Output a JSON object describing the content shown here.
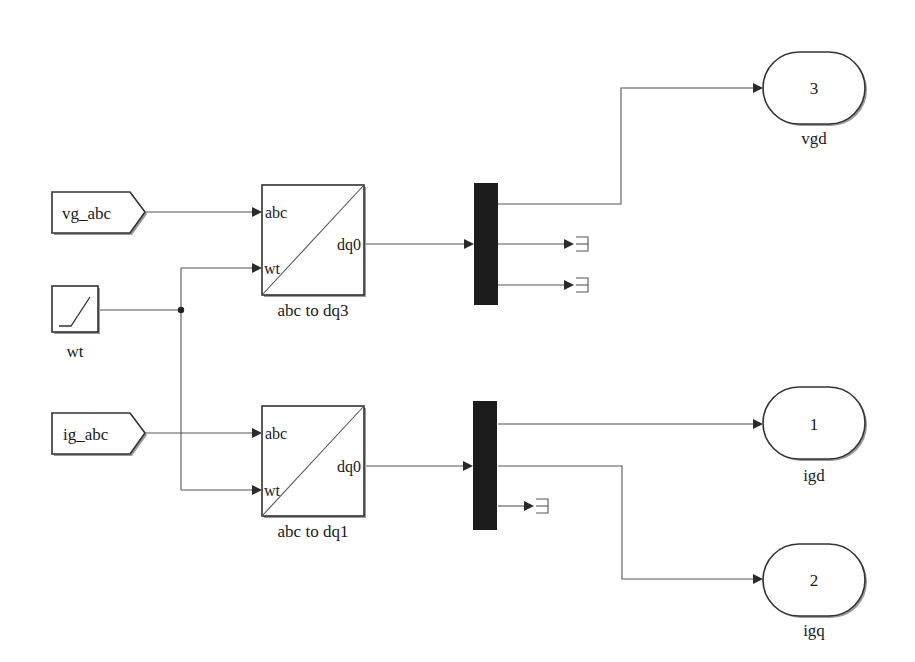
{
  "diagram": {
    "type": "simulink-block-diagram",
    "from_tags": [
      {
        "id": "from-vg-abc",
        "label": "vg_abc"
      },
      {
        "id": "from-ig-abc",
        "label": "ig_abc"
      }
    ],
    "sources": [
      {
        "id": "ramp-wt",
        "label": "wt",
        "icon": "ramp-icon"
      }
    ],
    "transforms": [
      {
        "id": "abc-to-dq3",
        "name": "abc to dq3",
        "inputs": [
          "abc",
          "wt"
        ],
        "output": "dq0"
      },
      {
        "id": "abc-to-dq1",
        "name": "abc to dq1",
        "inputs": [
          "abc",
          "wt"
        ],
        "output": "dq0"
      }
    ],
    "demuxes": [
      {
        "id": "demux-v",
        "outputs": 3
      },
      {
        "id": "demux-i",
        "outputs": 3
      }
    ],
    "outports": [
      {
        "id": "outport-vgd",
        "number": "3",
        "label": "vgd"
      },
      {
        "id": "outport-igd",
        "number": "1",
        "label": "igd"
      },
      {
        "id": "outport-igq",
        "number": "2",
        "label": "igq"
      }
    ],
    "terminators": 3,
    "connections": [
      {
        "from": "vg_abc",
        "to": "abc to dq3.abc"
      },
      {
        "from": "wt",
        "to": "abc to dq3.wt"
      },
      {
        "from": "wt",
        "to": "abc to dq1.wt"
      },
      {
        "from": "ig_abc",
        "to": "abc to dq1.abc"
      },
      {
        "from": "abc to dq3.dq0",
        "to": "demux-v"
      },
      {
        "from": "demux-v.1",
        "to": "vgd"
      },
      {
        "from": "demux-v.2",
        "to": "terminator"
      },
      {
        "from": "demux-v.3",
        "to": "terminator"
      },
      {
        "from": "abc to dq1.dq0",
        "to": "demux-i"
      },
      {
        "from": "demux-i.1",
        "to": "igd"
      },
      {
        "from": "demux-i.2",
        "to": "igq"
      },
      {
        "from": "demux-i.3",
        "to": "terminator"
      }
    ]
  },
  "colors": {
    "background": "#ffffff",
    "block_border": "#333333",
    "wire": "#555555",
    "demux_fill": "#1c1c1c"
  }
}
